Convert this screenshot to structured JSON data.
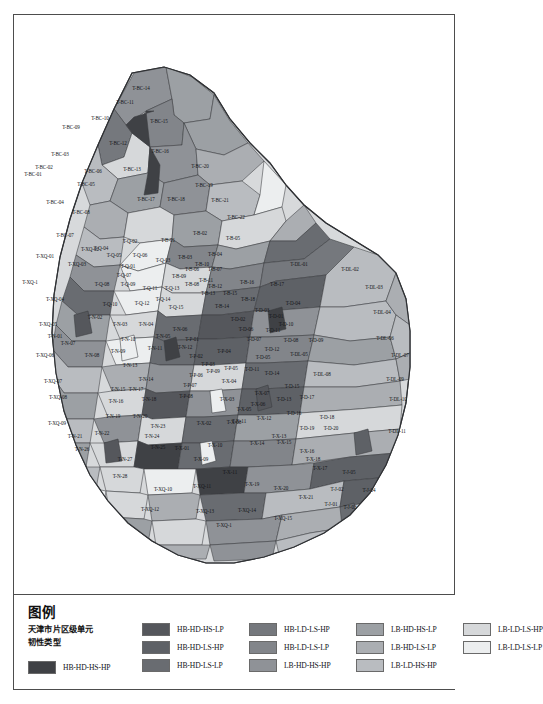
{
  "figure": {
    "kind": "choropleth-map",
    "region": "天津市"
  },
  "legend": {
    "title": "图例",
    "subtitle": "天津市片区级单元\n韧性类型",
    "columns": [
      {
        "items": [
          {
            "label": "HB-HD-HS-HP",
            "color": "#3f4145"
          }
        ]
      },
      {
        "items": [
          {
            "label": "HB-HD-HS-LP",
            "color": "#55575c"
          },
          {
            "label": "HB-HD-LS-HP",
            "color": "#5e6166"
          },
          {
            "label": "HB-HD-LS-LP",
            "color": "#696c71"
          }
        ]
      },
      {
        "items": [
          {
            "label": "HB-LD-LS-HP",
            "color": "#75787d"
          },
          {
            "label": "HB-LD-LS-LP",
            "color": "#82858a"
          },
          {
            "label": "LB-HD-HS-HP",
            "color": "#8f9297"
          }
        ]
      },
      {
        "items": [
          {
            "label": "LB-HD-HS-LP",
            "color": "#9ca0a4"
          },
          {
            "label": "LB-HD-LS-LP",
            "color": "#abaeb2"
          },
          {
            "label": "LB-LD-HS-HP",
            "color": "#b9bcc0"
          }
        ]
      },
      {
        "items": [
          {
            "label": "LB-LD-LS-HP",
            "color": "#d6d8da"
          },
          {
            "label": "LB-LD-LS-LP",
            "color": "#eceeef"
          }
        ]
      }
    ]
  },
  "chart_data": {
    "type": "map",
    "legend_position": "bottom",
    "classes": [
      "HB-HD-HS-HP",
      "HB-HD-HS-LP",
      "HB-HD-LS-HP",
      "HB-HD-LS-LP",
      "HB-LD-LS-HP",
      "HB-LD-LS-LP",
      "LB-HD-HS-HP",
      "LB-HD-HS-LP",
      "LB-HD-LS-LP",
      "LB-LD-HS-HP",
      "LB-LD-LS-HP",
      "LB-LD-LS-LP"
    ],
    "unit_labels": [
      "T-BC-01",
      "T-BC-02",
      "T-BC-03",
      "T-BC-04",
      "T-BC-05",
      "T-BC-06",
      "T-BC-07",
      "T-BC-08",
      "T-BC-09",
      "T-BC-10",
      "T-BC-11",
      "T-BC-12",
      "T-BC-13",
      "T-BC-14",
      "T-BC-15",
      "T-BC-16",
      "T-BC-17",
      "T-BC-18",
      "T-BC-19",
      "T-BC-20",
      "T-BC-21",
      "T-BC-22",
      "T-XQ-01",
      "T-XQ-02",
      "T-XQ-03",
      "T-XQ-04",
      "T-XQ-05",
      "T-XQ-06",
      "T-XQ-07",
      "T-XQ-08",
      "T-XQ-09",
      "T-XQ-10",
      "T-XQ-11",
      "T-XQ-12",
      "T-XQ-13",
      "T-XQ-14",
      "T-XQ-15",
      "T-Q-01",
      "T-Q-02",
      "T-Q-03",
      "T-Q-04",
      "T-Q-05",
      "T-Q-06",
      "T-Q-07",
      "T-Q-08",
      "T-Q-09",
      "T-Q-10",
      "T-Q-11",
      "T-Q-12",
      "T-Q-13",
      "T-Q-14",
      "T-Q-15",
      "T-B-01",
      "T-B-02",
      "T-B-03",
      "T-B-04",
      "T-B-05",
      "T-B-06",
      "T-B-07",
      "T-B-08",
      "T-B-09",
      "T-B-10",
      "T-B-11",
      "T-B-12",
      "T-B-13",
      "T-B-14",
      "T-B-15",
      "T-B-16",
      "T-B-17",
      "T-B-18",
      "T-N-01",
      "T-N-02",
      "T-N-03",
      "T-N-04",
      "T-N-05",
      "T-N-06",
      "T-N-07",
      "T-N-08",
      "T-N-09",
      "T-N-10",
      "T-N-11",
      "T-N-12",
      "T-N-13",
      "T-N-14",
      "T-N-15",
      "T-N-16",
      "T-N-17",
      "T-N-18",
      "T-N-19",
      "T-N-20",
      "T-N-21",
      "T-N-22",
      "T-N-23",
      "T-N-24",
      "T-N-25",
      "T-N-26",
      "T-N-27",
      "T-N-28",
      "T-P-01",
      "T-P-02",
      "T-P-03",
      "T-P-04",
      "T-P-05",
      "T-P-06",
      "T-P-07",
      "T-P-08",
      "T-P-09",
      "T-D-01",
      "T-D-02",
      "T-D-03",
      "T-D-04",
      "T-D-05",
      "T-D-06",
      "T-D-07",
      "T-D-08",
      "T-D-09",
      "T-D-10",
      "T-D-11",
      "T-D-12",
      "T-D-13",
      "T-D-14",
      "T-D-15",
      "T-D-16",
      "T-D-17",
      "T-D-18",
      "T-D-19",
      "T-D-20",
      "T-DL-01",
      "T-DL-02",
      "T-DL-03",
      "T-DL-04",
      "T-DL-05",
      "T-DL-06",
      "T-DL-07",
      "T-DL-08",
      "T-DL-09",
      "T-DL-10",
      "T-DL-11",
      "T-X-01",
      "T-X-02",
      "T-X-03",
      "T-X-04",
      "T-X-05",
      "T-X-06",
      "T-X-07",
      "T-X-08",
      "T-X-09",
      "T-X-10",
      "T-X-11",
      "T-X-12",
      "T-X-13",
      "T-X-14",
      "T-X-15",
      "T-X-16",
      "T-X-17",
      "T-X-18",
      "T-X-19",
      "T-X-20",
      "T-X-21",
      "T-J-01",
      "T-J-02",
      "T-J-03",
      "T-J-04",
      "T-J-05"
    ]
  },
  "map_labels": [
    {
      "t": "T-BC-14",
      "x": 141,
      "y": 89
    },
    {
      "t": "T-BC-11",
      "x": 125,
      "y": 103
    },
    {
      "t": "T-BC-10",
      "x": 100,
      "y": 119
    },
    {
      "t": "T-BC-15",
      "x": 159,
      "y": 122
    },
    {
      "t": "T-BC-09",
      "x": 71,
      "y": 128
    },
    {
      "t": "T-BC-12",
      "x": 118,
      "y": 144
    },
    {
      "t": "T-BC-16",
      "x": 160,
      "y": 152
    },
    {
      "t": "T-BC-03",
      "x": 60,
      "y": 155
    },
    {
      "t": "T-BC-02",
      "x": 44,
      "y": 168
    },
    {
      "t": "T-BC-06",
      "x": 93,
      "y": 172
    },
    {
      "t": "T-BC-13",
      "x": 132,
      "y": 170
    },
    {
      "t": "T-BC-20",
      "x": 200,
      "y": 167
    },
    {
      "t": "T-BC-01",
      "x": 33,
      "y": 175
    },
    {
      "t": "T-BC-05",
      "x": 86,
      "y": 185
    },
    {
      "t": "T-BC-19",
      "x": 204,
      "y": 186
    },
    {
      "t": "T-BC-04",
      "x": 55,
      "y": 203
    },
    {
      "t": "T-BC-17",
      "x": 146,
      "y": 200
    },
    {
      "t": "T-BC-18",
      "x": 176,
      "y": 200
    },
    {
      "t": "T-BC-21",
      "x": 220,
      "y": 201
    },
    {
      "t": "T-BC-08",
      "x": 81,
      "y": 213
    },
    {
      "t": "T-BC-22",
      "x": 236,
      "y": 218
    },
    {
      "t": "T-BC-07",
      "x": 65,
      "y": 236
    },
    {
      "t": "T-XQ-02",
      "x": 90,
      "y": 250
    },
    {
      "t": "T-Q-02",
      "x": 130,
      "y": 242
    },
    {
      "t": "T-B-01",
      "x": 168,
      "y": 241
    },
    {
      "t": "T-B-02",
      "x": 200,
      "y": 234
    },
    {
      "t": "T-B-05",
      "x": 233,
      "y": 239
    },
    {
      "t": "T-XQ-01",
      "x": 45,
      "y": 257
    },
    {
      "t": "T-Q-05",
      "x": 114,
      "y": 256
    },
    {
      "t": "T-Q-06",
      "x": 140,
      "y": 256
    },
    {
      "t": "T-B-03",
      "x": 185,
      "y": 258
    },
    {
      "t": "T-B-04",
      "x": 215,
      "y": 255
    },
    {
      "t": "T-Q-01",
      "x": 128,
      "y": 267
    },
    {
      "t": "T-XQ-03",
      "x": 77,
      "y": 265
    },
    {
      "t": "T-B-06",
      "x": 192,
      "y": 270
    },
    {
      "t": "T-B-07",
      "x": 215,
      "y": 270
    },
    {
      "t": "T-DL-01",
      "x": 299,
      "y": 265
    },
    {
      "t": "T-DL-02",
      "x": 350,
      "y": 270
    },
    {
      "t": "T-Q-08",
      "x": 102,
      "y": 285
    },
    {
      "t": "T-Q-09",
      "x": 128,
      "y": 285
    },
    {
      "t": "T-XQ-1",
      "x": 30,
      "y": 283
    },
    {
      "t": "T-Q-11",
      "x": 150,
      "y": 289
    },
    {
      "t": "T-Q-13",
      "x": 172,
      "y": 289
    },
    {
      "t": "T-B-08",
      "x": 192,
      "y": 285
    },
    {
      "t": "T-B-12",
      "x": 215,
      "y": 287
    },
    {
      "t": "T-B-16",
      "x": 247,
      "y": 283
    },
    {
      "t": "T-B-17",
      "x": 277,
      "y": 285
    },
    {
      "t": "T-DL-03",
      "x": 374,
      "y": 288
    },
    {
      "t": "T-XQ-04",
      "x": 55,
      "y": 300
    },
    {
      "t": "T-Q-10",
      "x": 110,
      "y": 305
    },
    {
      "t": "T-Q-12",
      "x": 142,
      "y": 304
    },
    {
      "t": "T-Q-15",
      "x": 176,
      "y": 308
    },
    {
      "t": "T-B-14",
      "x": 222,
      "y": 307
    },
    {
      "t": "T-D-04",
      "x": 293,
      "y": 304
    },
    {
      "t": "T-N-02",
      "x": 95,
      "y": 318
    },
    {
      "t": "T-Q-14",
      "x": 163,
      "y": 300
    },
    {
      "t": "T-B-18",
      "x": 248,
      "y": 300
    },
    {
      "t": "T-D-01",
      "x": 276,
      "y": 317
    },
    {
      "t": "T-D-03",
      "x": 262,
      "y": 311
    },
    {
      "t": "T-DL-04",
      "x": 382,
      "y": 313
    },
    {
      "t": "T-XQ-05",
      "x": 48,
      "y": 325
    },
    {
      "t": "T-N-03",
      "x": 120,
      "y": 325
    },
    {
      "t": "T-N-04",
      "x": 146,
      "y": 325
    },
    {
      "t": "T-N-06",
      "x": 180,
      "y": 330
    },
    {
      "t": "T-D-02",
      "x": 238,
      "y": 320
    },
    {
      "t": "T-D-11",
      "x": 273,
      "y": 331
    },
    {
      "t": "T-N-01",
      "x": 55,
      "y": 337
    },
    {
      "t": "T-N-10",
      "x": 128,
      "y": 340
    },
    {
      "t": "T-N-05",
      "x": 163,
      "y": 337
    },
    {
      "t": "T-P-01",
      "x": 192,
      "y": 340
    },
    {
      "t": "T-D-08",
      "x": 291,
      "y": 341
    },
    {
      "t": "T-D-09",
      "x": 316,
      "y": 341
    },
    {
      "t": "T-DL-06",
      "x": 385,
      "y": 339
    },
    {
      "t": "T-XQ-06",
      "x": 45,
      "y": 356
    },
    {
      "t": "T-N-08",
      "x": 92,
      "y": 356
    },
    {
      "t": "T-N-09",
      "x": 118,
      "y": 352
    },
    {
      "t": "T-N-11",
      "x": 155,
      "y": 349
    },
    {
      "t": "T-N-12",
      "x": 185,
      "y": 348
    },
    {
      "t": "T-P-02",
      "x": 196,
      "y": 357
    },
    {
      "t": "T-P-04",
      "x": 224,
      "y": 352
    },
    {
      "t": "T-D-05",
      "x": 263,
      "y": 358
    },
    {
      "t": "T-DL-05",
      "x": 299,
      "y": 355
    },
    {
      "t": "T-DL-07",
      "x": 400,
      "y": 356
    },
    {
      "t": "T-N-13",
      "x": 130,
      "y": 366
    },
    {
      "t": "T-P-03",
      "x": 208,
      "y": 365
    },
    {
      "t": "T-D-11",
      "x": 252,
      "y": 370
    },
    {
      "t": "T-DL-08",
      "x": 322,
      "y": 375
    },
    {
      "t": "T-XQ-07",
      "x": 53,
      "y": 382
    },
    {
      "t": "T-N-14",
      "x": 146,
      "y": 380
    },
    {
      "t": "T-P-06",
      "x": 196,
      "y": 376
    },
    {
      "t": "T-P-09",
      "x": 213,
      "y": 372
    },
    {
      "t": "T-P-05",
      "x": 231,
      "y": 369
    },
    {
      "t": "T-D-14",
      "x": 272,
      "y": 374
    },
    {
      "t": "T-DL-09",
      "x": 395,
      "y": 380
    },
    {
      "t": "T-N-15",
      "x": 118,
      "y": 390
    },
    {
      "t": "T-N-17",
      "x": 136,
      "y": 390
    },
    {
      "t": "T-P-07",
      "x": 190,
      "y": 386
    },
    {
      "t": "T-X-04",
      "x": 229,
      "y": 382
    },
    {
      "t": "T-D-15",
      "x": 292,
      "y": 387
    },
    {
      "t": "T-XQ-08",
      "x": 58,
      "y": 398
    },
    {
      "t": "T-N-16",
      "x": 116,
      "y": 402
    },
    {
      "t": "T-N-18",
      "x": 149,
      "y": 400
    },
    {
      "t": "T-P-08",
      "x": 186,
      "y": 397
    },
    {
      "t": "T-X-03",
      "x": 227,
      "y": 400
    },
    {
      "t": "T-X-07",
      "x": 262,
      "y": 394
    },
    {
      "t": "T-D-13",
      "x": 284,
      "y": 400
    },
    {
      "t": "T-D-17",
      "x": 307,
      "y": 398
    },
    {
      "t": "T-DL-10",
      "x": 398,
      "y": 400
    },
    {
      "t": "T-N-19",
      "x": 113,
      "y": 417
    },
    {
      "t": "T-N-20",
      "x": 140,
      "y": 417
    },
    {
      "t": "T-X-06",
      "x": 258,
      "y": 405
    },
    {
      "t": "T-D-16",
      "x": 294,
      "y": 414
    },
    {
      "t": "T-D-18",
      "x": 327,
      "y": 418
    },
    {
      "t": "T-XQ-09",
      "x": 57,
      "y": 424
    },
    {
      "t": "T-N-23",
      "x": 158,
      "y": 427
    },
    {
      "t": "T-X-02",
      "x": 204,
      "y": 424
    },
    {
      "t": "T-X-08",
      "x": 234,
      "y": 423
    },
    {
      "t": "T-X-12",
      "x": 264,
      "y": 419
    },
    {
      "t": "T-X-11",
      "x": 239,
      "y": 422
    },
    {
      "t": "T-D-19",
      "x": 307,
      "y": 429
    },
    {
      "t": "T-D-20",
      "x": 331,
      "y": 429
    },
    {
      "t": "T-DL-11",
      "x": 397,
      "y": 432
    },
    {
      "t": "T-N-21",
      "x": 75,
      "y": 437
    },
    {
      "t": "T-N-22",
      "x": 102,
      "y": 434
    },
    {
      "t": "T-N-24",
      "x": 152,
      "y": 437
    },
    {
      "t": "T-X-13",
      "x": 279,
      "y": 437
    },
    {
      "t": "T-N-26",
      "x": 82,
      "y": 450
    },
    {
      "t": "T-N-25",
      "x": 158,
      "y": 448
    },
    {
      "t": "T-X-01",
      "x": 182,
      "y": 449
    },
    {
      "t": "T-X-10",
      "x": 215,
      "y": 446
    },
    {
      "t": "T-X-14",
      "x": 257,
      "y": 444
    },
    {
      "t": "T-X-15",
      "x": 284,
      "y": 443
    },
    {
      "t": "T-X-09",
      "x": 201,
      "y": 460
    },
    {
      "t": "T-X-18",
      "x": 313,
      "y": 460
    },
    {
      "t": "T-N-27",
      "x": 125,
      "y": 460
    },
    {
      "t": "T-X-16",
      "x": 307,
      "y": 452
    },
    {
      "t": "T-X-17",
      "x": 320,
      "y": 469
    },
    {
      "t": "T-J-05",
      "x": 349,
      "y": 473
    },
    {
      "t": "T-N-28",
      "x": 120,
      "y": 477
    },
    {
      "t": "T-X-19",
      "x": 252,
      "y": 485
    },
    {
      "t": "T-X-11",
      "x": 230,
      "y": 473
    },
    {
      "t": "T-XQ-11",
      "x": 202,
      "y": 487
    },
    {
      "t": "T-X-20",
      "x": 281,
      "y": 489
    },
    {
      "t": "T-J-02",
      "x": 337,
      "y": 490
    },
    {
      "t": "T-J-04",
      "x": 369,
      "y": 491
    },
    {
      "t": "T-XQ-10",
      "x": 163,
      "y": 490
    },
    {
      "t": "T-X-21",
      "x": 306,
      "y": 498
    },
    {
      "t": "T-J-01",
      "x": 331,
      "y": 505
    },
    {
      "t": "T-J-03",
      "x": 350,
      "y": 508
    },
    {
      "t": "T-XQ-12",
      "x": 150,
      "y": 510
    },
    {
      "t": "T-XQ-13",
      "x": 205,
      "y": 512
    },
    {
      "t": "T-XQ-14",
      "x": 247,
      "y": 511
    },
    {
      "t": "T-XQ-15",
      "x": 283,
      "y": 519
    },
    {
      "t": "T-XQ-1",
      "x": 224,
      "y": 526
    },
    {
      "t": "T-Q-03",
      "x": 163,
      "y": 261
    },
    {
      "t": "T-Q-04",
      "x": 101,
      "y": 249
    },
    {
      "t": "T-Q-07",
      "x": 124,
      "y": 276
    },
    {
      "t": "T-B-09",
      "x": 179,
      "y": 277
    },
    {
      "t": "T-B-10",
      "x": 202,
      "y": 265
    },
    {
      "t": "T-B-11",
      "x": 206,
      "y": 281
    },
    {
      "t": "T-B-13",
      "x": 208,
      "y": 294
    },
    {
      "t": "T-B-15",
      "x": 230,
      "y": 294
    },
    {
      "t": "T-D-06",
      "x": 246,
      "y": 330
    },
    {
      "t": "T-D-07",
      "x": 254,
      "y": 340
    },
    {
      "t": "T-D-10",
      "x": 286,
      "y": 325
    },
    {
      "t": "T-D-12",
      "x": 272,
      "y": 350
    },
    {
      "t": "T-X-05",
      "x": 244,
      "y": 410
    },
    {
      "t": "T-N-07",
      "x": 68,
      "y": 344
    }
  ]
}
